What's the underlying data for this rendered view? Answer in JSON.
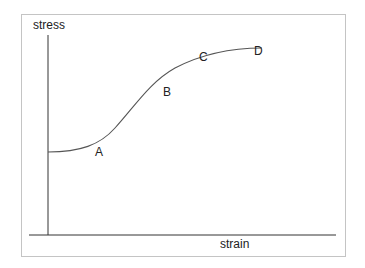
{
  "diagram": {
    "title": "",
    "y_axis_label": "stress",
    "x_axis_label": "strain",
    "points": [
      {
        "id": "A",
        "label": "A"
      },
      {
        "id": "B",
        "label": "B"
      },
      {
        "id": "C",
        "label": "C"
      },
      {
        "id": "D",
        "label": "D"
      }
    ],
    "colors": {
      "axis": "#333333",
      "curve": "#555555",
      "frame": "#c4c4c4",
      "text": "#222222"
    }
  }
}
